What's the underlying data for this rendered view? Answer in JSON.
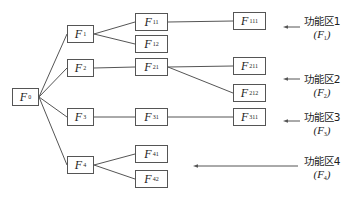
{
  "diagram": {
    "type": "tree",
    "root": "F0",
    "nodes": [
      {
        "id": "F0",
        "base": "F",
        "sub": "0",
        "x": 12,
        "y": 88,
        "w": 27,
        "h": 18
      },
      {
        "id": "F1",
        "base": "F",
        "sub": "1",
        "x": 67,
        "y": 25,
        "w": 27,
        "h": 18
      },
      {
        "id": "F2",
        "base": "F",
        "sub": "2",
        "x": 67,
        "y": 59,
        "w": 27,
        "h": 18
      },
      {
        "id": "F3",
        "base": "F",
        "sub": "3",
        "x": 67,
        "y": 108,
        "w": 27,
        "h": 18
      },
      {
        "id": "F4",
        "base": "F",
        "sub": "4",
        "x": 67,
        "y": 156,
        "w": 27,
        "h": 18
      },
      {
        "id": "F11",
        "base": "F",
        "sub": "11",
        "x": 135,
        "y": 13,
        "w": 33,
        "h": 18
      },
      {
        "id": "F12",
        "base": "F",
        "sub": "12",
        "x": 135,
        "y": 35,
        "w": 33,
        "h": 18
      },
      {
        "id": "F21",
        "base": "F",
        "sub": "21",
        "x": 135,
        "y": 58,
        "w": 33,
        "h": 18
      },
      {
        "id": "F31",
        "base": "F",
        "sub": "31",
        "x": 135,
        "y": 108,
        "w": 33,
        "h": 18
      },
      {
        "id": "F41",
        "base": "F",
        "sub": "41",
        "x": 135,
        "y": 145,
        "w": 33,
        "h": 18
      },
      {
        "id": "F42",
        "base": "F",
        "sub": "42",
        "x": 135,
        "y": 170,
        "w": 33,
        "h": 18
      },
      {
        "id": "F111",
        "base": "F",
        "sub": "111",
        "x": 233,
        "y": 12,
        "w": 33,
        "h": 18
      },
      {
        "id": "F211",
        "base": "F",
        "sub": "211",
        "x": 233,
        "y": 57,
        "w": 33,
        "h": 18
      },
      {
        "id": "F212",
        "base": "F",
        "sub": "212",
        "x": 233,
        "y": 84,
        "w": 33,
        "h": 18
      },
      {
        "id": "F311",
        "base": "F",
        "sub": "311",
        "x": 233,
        "y": 108,
        "w": 33,
        "h": 18
      }
    ],
    "edges": [
      [
        "F0",
        "F1"
      ],
      [
        "F0",
        "F2"
      ],
      [
        "F0",
        "F3"
      ],
      [
        "F0",
        "F4"
      ],
      [
        "F1",
        "F11"
      ],
      [
        "F1",
        "F12"
      ],
      [
        "F2",
        "F21"
      ],
      [
        "F3",
        "F31"
      ],
      [
        "F4",
        "F41"
      ],
      [
        "F4",
        "F42"
      ],
      [
        "F11",
        "F111"
      ],
      [
        "F21",
        "F211"
      ],
      [
        "F21",
        "F212"
      ],
      [
        "F31",
        "F311"
      ]
    ],
    "zones": [
      {
        "name": "功能区1",
        "symbol_base": "F",
        "symbol_sub": "1",
        "x": 296,
        "y": 15,
        "arrow": {
          "x1": 300,
          "x2": 283,
          "y": 27
        }
      },
      {
        "name": "功能区2",
        "symbol_base": "F",
        "symbol_sub": "2",
        "x": 296,
        "y": 73,
        "arrow": {
          "x1": 300,
          "x2": 283,
          "y": 79
        }
      },
      {
        "name": "功能区3",
        "symbol_base": "F",
        "symbol_sub": "3",
        "x": 296,
        "y": 111,
        "arrow": {
          "x1": 300,
          "x2": 283,
          "y": 121
        }
      },
      {
        "name": "功能区4",
        "symbol_base": "F",
        "symbol_sub": "4",
        "x": 296,
        "y": 155,
        "arrow": {
          "x1": 298,
          "x2": 193,
          "y": 166
        }
      }
    ],
    "colors": {
      "line": "#555555",
      "text": "#222222",
      "background": "#ffffff"
    }
  }
}
